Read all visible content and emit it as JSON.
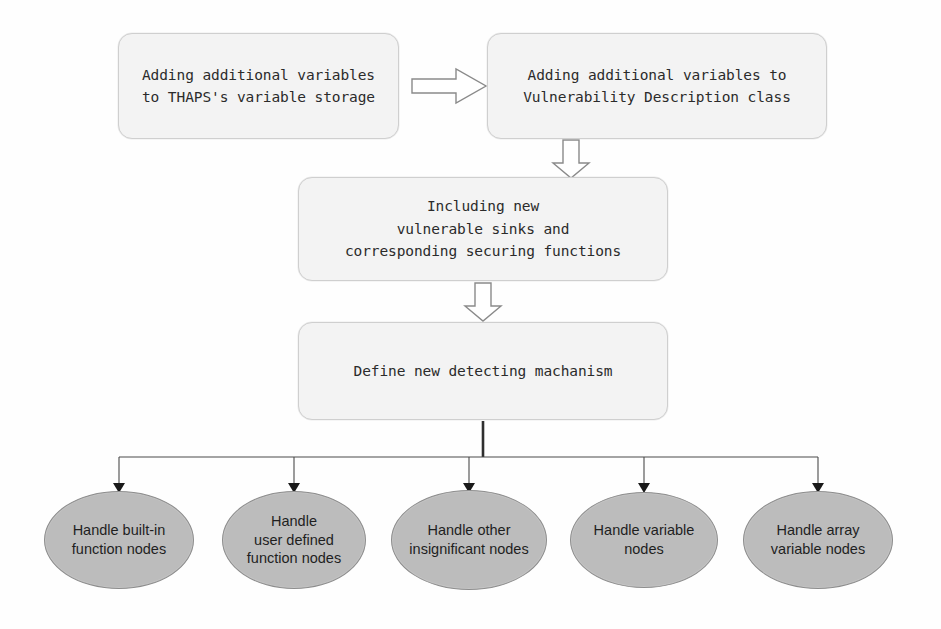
{
  "diagram": {
    "type": "flowchart",
    "colors": {
      "process_fill": "#f3f3f3",
      "process_border": "#cfcfcf",
      "terminator_fill": "#bcbcbc",
      "terminator_border": "#8d8d8d",
      "connector": "#4a4a4a",
      "background": "#ffffff"
    }
  },
  "process_nodes": [
    {
      "id": "add-vars-thaps",
      "text": "Adding additional variables\nto THAPS's variable storage",
      "x": 118,
      "y": 33,
      "w": 281,
      "h": 106
    },
    {
      "id": "add-vars-vuln-desc",
      "text": "Adding additional variables to\nVulnerability Description class",
      "x": 487,
      "y": 33,
      "w": 340,
      "h": 106
    },
    {
      "id": "including-new-sinks",
      "text": "Including new\nvulnerable sinks and\ncorresponding securing functions",
      "x": 298,
      "y": 177,
      "w": 370,
      "h": 104
    },
    {
      "id": "define-mechanism",
      "text": "Define new detecting machanism",
      "x": 298,
      "y": 322,
      "w": 370,
      "h": 98
    }
  ],
  "terminator_nodes": [
    {
      "id": "handle-builtin-function-nodes",
      "text": "Handle built-in\nfunction nodes",
      "cx": 119,
      "cy": 540,
      "rx": 75,
      "ry": 49
    },
    {
      "id": "handle-user-defined-function-nodes",
      "text": "Handle\nuser defined\nfunction nodes",
      "cx": 294,
      "cy": 540,
      "rx": 72,
      "ry": 49
    },
    {
      "id": "handle-other-insignificant-nodes",
      "text": "Handle other\ninsignificant nodes",
      "cx": 469,
      "cy": 540,
      "rx": 78,
      "ry": 50
    },
    {
      "id": "handle-variable-nodes",
      "text": "Handle variable\nnodes",
      "cx": 644,
      "cy": 540,
      "rx": 74,
      "ry": 48
    },
    {
      "id": "handle-array-variable-nodes",
      "text": "Handle array\nvariable nodes",
      "cx": 818,
      "cy": 540,
      "rx": 75,
      "ry": 49
    }
  ],
  "connectors": [
    {
      "id": "arrow-box1-to-box2",
      "kind": "block-arrow-right",
      "from": "add-vars-thaps",
      "to": "add-vars-vuln-desc"
    },
    {
      "id": "arrow-box2-to-box3",
      "kind": "block-arrow-down",
      "from": "add-vars-vuln-desc",
      "to": "including-new-sinks"
    },
    {
      "id": "arrow-box3-to-box4",
      "kind": "block-arrow-down",
      "from": "including-new-sinks",
      "to": "define-mechanism"
    },
    {
      "id": "fanout-bus",
      "kind": "bus-fanout",
      "from": "define-mechanism",
      "bus_y": 457,
      "branch_x": [
        119,
        294,
        469,
        644,
        818
      ]
    }
  ]
}
